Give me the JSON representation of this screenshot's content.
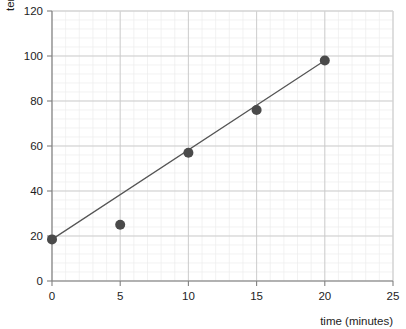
{
  "chart_data": {
    "type": "scatter",
    "title": "",
    "subtitle": "",
    "xlabel": "time (minutes)",
    "ylabel": "temperature (°C)",
    "xlim": [
      0,
      25
    ],
    "ylim": [
      0,
      120
    ],
    "xticks": [
      0,
      5,
      10,
      15,
      20,
      25
    ],
    "yticks": [
      0,
      20,
      40,
      60,
      80,
      100,
      120
    ],
    "xtick_labels": [
      "0",
      "5",
      "10",
      "15",
      "20",
      "25"
    ],
    "ytick_labels": [
      "0",
      "20",
      "40",
      "60",
      "80",
      "100",
      "120"
    ],
    "x_minor_step": 1,
    "y_minor_step": 4,
    "grid": true,
    "grid_minor": true,
    "legend": false,
    "legend_position": "none",
    "annotations": [],
    "series": [
      {
        "name": "measurements",
        "type": "scatter",
        "marker": "circle",
        "marker_size": 5,
        "color": "#4a4a4a",
        "x": [
          0,
          5,
          10,
          15,
          20
        ],
        "values": [
          18.5,
          25,
          57,
          76,
          98
        ],
        "points": [
          {
            "x": 0,
            "y": 18.5
          },
          {
            "x": 5,
            "y": 25
          },
          {
            "x": 10,
            "y": 57
          },
          {
            "x": 15,
            "y": 76
          },
          {
            "x": 20,
            "y": 98
          }
        ]
      },
      {
        "name": "line-of-best-fit",
        "type": "line",
        "color": "#555555",
        "width": 1.2,
        "x": [
          0,
          20
        ],
        "values": [
          18.5,
          98
        ]
      }
    ],
    "colors": {
      "marker": "#4a4a4a",
      "line": "#555555",
      "axis": "#808080",
      "grid_major": "#c9c9c9",
      "grid_minor": "#ededed",
      "plot_background": "#ffffff",
      "text": "#1d1d1d"
    }
  }
}
